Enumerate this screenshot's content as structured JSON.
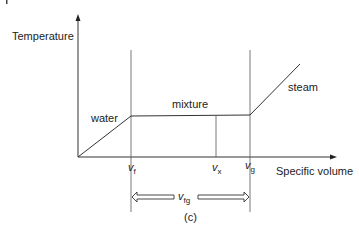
{
  "figure": {
    "caption": "(c)",
    "axes": {
      "y_label": "Temperature",
      "x_label": "Specific volume"
    },
    "regions": {
      "water": "water",
      "mixture": "mixture",
      "steam": "steam"
    },
    "markers": {
      "vf": {
        "base": "v",
        "sub": "f"
      },
      "vx": {
        "base": "v",
        "sub": "x"
      },
      "vg": {
        "base": "v",
        "sub": "g"
      },
      "vfg": {
        "base": "v",
        "sub": "fg"
      }
    },
    "colors": {
      "line": "#333333",
      "text": "#222222",
      "background": "#ffffff"
    }
  }
}
